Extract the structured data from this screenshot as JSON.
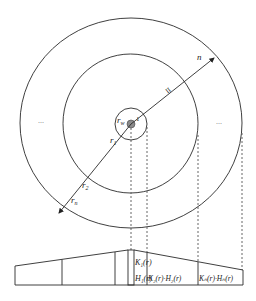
{
  "diagram": {
    "type": "radial-composite-reservoir",
    "rings": [
      {
        "id": "wellbore",
        "label": "r_w"
      },
      {
        "id": "inner",
        "label": "r_1"
      },
      {
        "id": "middle",
        "label": "r_2"
      },
      {
        "id": "outer",
        "label": "r_n"
      }
    ],
    "labels": {
      "rw_main": "r",
      "rw_sub": "w",
      "one": "1",
      "two_on_arrow": "II",
      "n_on_arrow": "n",
      "r1_main": "r",
      "r1_sub": "1",
      "r2_main": "r",
      "r2_sub": "2",
      "rn_main": "r",
      "rn_sub": "n",
      "ellipsis_left": "...",
      "ellipsis_right": "..."
    },
    "profile": {
      "zone1_k": "K₁(r)",
      "zone1_h": "H₁(r)",
      "zone2": "K₂(r)·H₂(r)",
      "zonen": "Kₙ(r)·Hₙ(r)"
    }
  }
}
